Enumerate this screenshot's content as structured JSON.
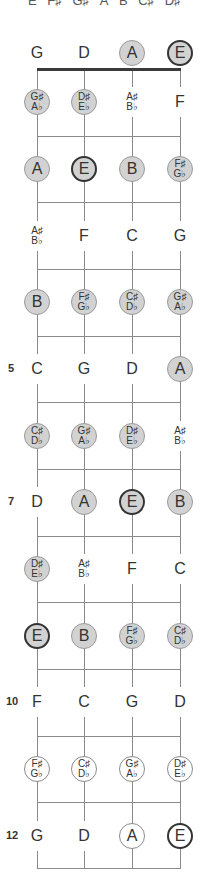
{
  "scale_header": {
    "notes": [
      "E",
      "F♯",
      "G♯",
      "A",
      "B",
      "C♯",
      "D♯"
    ]
  },
  "strings": [
    "G",
    "D",
    "A",
    "E"
  ],
  "string_x": [
    37,
    84,
    132,
    180
  ],
  "nut_y": 69,
  "fret_lines_y": [
    136,
    202,
    269,
    336,
    402,
    469,
    536,
    602,
    669,
    736,
    802,
    868
  ],
  "fret_numbers": [
    {
      "fret": 5,
      "label": "5"
    },
    {
      "fret": 7,
      "label": "7"
    },
    {
      "fret": 10,
      "label": "10"
    },
    {
      "fret": 12,
      "label": "12"
    }
  ],
  "colors": {
    "highlight_fill": "#d2d2d2",
    "highlight_border": "#9a9a9a",
    "root_border": "#333333",
    "line": "#8a8a8a",
    "nut": "#3a3a3a"
  },
  "rows": [
    {
      "fret": 0,
      "y": 53,
      "notes": [
        {
          "top": "G",
          "style": "plain"
        },
        {
          "top": "D",
          "style": "plain"
        },
        {
          "top": "A",
          "style": "hl"
        },
        {
          "top": "E",
          "style": "hl root"
        }
      ]
    },
    {
      "fret": 1,
      "y": 102,
      "notes": [
        {
          "top": "G♯",
          "bottom": "A♭",
          "style": "hl"
        },
        {
          "top": "D♯",
          "bottom": "E♭",
          "style": "hl"
        },
        {
          "top": "A♯",
          "bottom": "B♭",
          "style": "plain"
        },
        {
          "top": "F",
          "style": "plain"
        }
      ]
    },
    {
      "fret": 2,
      "y": 169,
      "notes": [
        {
          "top": "A",
          "style": "hl"
        },
        {
          "top": "E",
          "style": "hl root"
        },
        {
          "top": "B",
          "style": "hl"
        },
        {
          "top": "F♯",
          "bottom": "G♭",
          "style": "hl"
        }
      ]
    },
    {
      "fret": 3,
      "y": 236,
      "notes": [
        {
          "top": "A♯",
          "bottom": "B♭",
          "style": "plain"
        },
        {
          "top": "F",
          "style": "plain"
        },
        {
          "top": "C",
          "style": "plain"
        },
        {
          "top": "G",
          "style": "plain"
        }
      ]
    },
    {
      "fret": 4,
      "y": 302,
      "notes": [
        {
          "top": "B",
          "style": "hl"
        },
        {
          "top": "F♯",
          "bottom": "G♭",
          "style": "hl"
        },
        {
          "top": "C♯",
          "bottom": "D♭",
          "style": "hl"
        },
        {
          "top": "G♯",
          "bottom": "A♭",
          "style": "hl"
        }
      ]
    },
    {
      "fret": 5,
      "y": 369,
      "notes": [
        {
          "top": "C",
          "style": "plain"
        },
        {
          "top": "G",
          "style": "plain"
        },
        {
          "top": "D",
          "style": "plain"
        },
        {
          "top": "A",
          "style": "hl"
        }
      ]
    },
    {
      "fret": 6,
      "y": 436,
      "notes": [
        {
          "top": "C♯",
          "bottom": "D♭",
          "style": "hl"
        },
        {
          "top": "G♯",
          "bottom": "A♭",
          "style": "hl"
        },
        {
          "top": "D♯",
          "bottom": "E♭",
          "style": "hl"
        },
        {
          "top": "A♯",
          "bottom": "B♭",
          "style": "plain"
        }
      ]
    },
    {
      "fret": 7,
      "y": 502,
      "notes": [
        {
          "top": "D",
          "style": "plain"
        },
        {
          "top": "A",
          "style": "hl"
        },
        {
          "top": "E",
          "style": "hl root"
        },
        {
          "top": "B",
          "style": "hl"
        }
      ]
    },
    {
      "fret": 8,
      "y": 569,
      "notes": [
        {
          "top": "D♯",
          "bottom": "E♭",
          "style": "hl"
        },
        {
          "top": "A♯",
          "bottom": "B♭",
          "style": "plain"
        },
        {
          "top": "F",
          "style": "plain"
        },
        {
          "top": "C",
          "style": "plain"
        }
      ]
    },
    {
      "fret": 9,
      "y": 636,
      "notes": [
        {
          "top": "E",
          "style": "hl root"
        },
        {
          "top": "B",
          "style": "hl"
        },
        {
          "top": "F♯",
          "bottom": "G♭",
          "style": "hl"
        },
        {
          "top": "C♯",
          "bottom": "D♭",
          "style": "hl"
        }
      ]
    },
    {
      "fret": 10,
      "y": 702,
      "notes": [
        {
          "top": "F",
          "style": "plain"
        },
        {
          "top": "C",
          "style": "plain"
        },
        {
          "top": "G",
          "style": "plain"
        },
        {
          "top": "D",
          "style": "plain"
        }
      ]
    },
    {
      "fret": 11,
      "y": 769,
      "notes": [
        {
          "top": "F♯",
          "bottom": "G♭",
          "style": "hlw"
        },
        {
          "top": "C♯",
          "bottom": "D♭",
          "style": "hlw"
        },
        {
          "top": "G♯",
          "bottom": "A♭",
          "style": "hlw"
        },
        {
          "top": "D♯",
          "bottom": "E♭",
          "style": "hlw"
        }
      ]
    },
    {
      "fret": 12,
      "y": 836,
      "notes": [
        {
          "top": "G",
          "style": "plain"
        },
        {
          "top": "D",
          "style": "plain"
        },
        {
          "top": "A",
          "style": "hlw"
        },
        {
          "top": "E",
          "style": "hlw root"
        }
      ]
    }
  ]
}
